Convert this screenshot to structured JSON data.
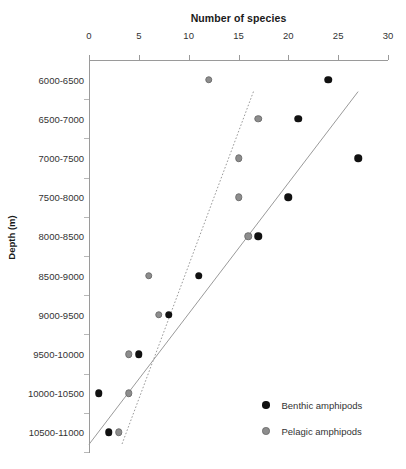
{
  "chart_data": {
    "type": "scatter",
    "title": "",
    "xlabel": "Number of species",
    "ylabel": "Depth (m)",
    "xlim": [
      0,
      30
    ],
    "x_ticks": [
      0,
      5,
      10,
      15,
      20,
      25,
      30
    ],
    "x_tick_labels": [
      "0",
      "5",
      "10",
      "15",
      "20",
      "25",
      "30"
    ],
    "grid": false,
    "x_axis_position": "top",
    "y_axis_inverted": true,
    "legend_position": "bottom-right",
    "categories": [
      "6000-6500",
      "6500-7000",
      "7000-7500",
      "7500-8000",
      "8000-8500",
      "8500-9000",
      "9000-9500",
      "9500-10000",
      "10000-10500",
      "10500-11000"
    ],
    "series": [
      {
        "name": "Benthic amphipods",
        "color": "#111111",
        "marker": "filled-circle",
        "values": [
          24,
          21,
          27,
          20,
          17,
          11,
          8,
          5,
          1,
          2
        ]
      },
      {
        "name": "Pelagic amphipods",
        "color": "#8d8d8d",
        "marker": "filled-circle",
        "values": [
          12,
          17,
          15,
          15,
          16,
          6,
          7,
          4,
          4,
          3
        ]
      }
    ],
    "trendlines": [
      {
        "name": "benthic-trendline",
        "style": "solid",
        "color": "#9a9a9a",
        "x_top": 27.0,
        "y_top_category_index": 0,
        "x_bottom": 0.0,
        "y_bottom_category_index": 9
      },
      {
        "name": "pelagic-trendline",
        "style": "dotted",
        "color": "#9a9a9a",
        "x_top": 16.5,
        "y_top_category_index": 0,
        "x_bottom": 3.3,
        "y_bottom_category_index": 9
      }
    ]
  },
  "legend": {
    "items": [
      {
        "label": "Benthic amphipods",
        "color": "#111111"
      },
      {
        "label": "Pelagic amphipods",
        "color": "#8d8d8d"
      }
    ]
  }
}
